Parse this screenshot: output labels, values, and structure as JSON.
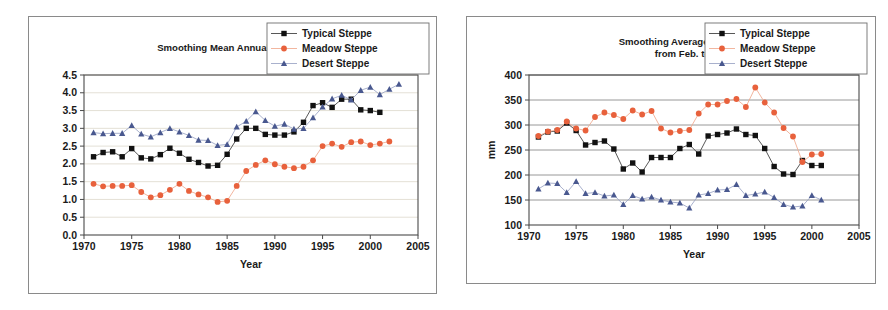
{
  "figure": {
    "background": "#ffffff",
    "panel_border": "#8a8a8a"
  },
  "series_styles": {
    "typical": {
      "name": "Typical Steppe",
      "color": "#111111",
      "line_color": "#3a3a3a",
      "marker": "square"
    },
    "meadow": {
      "name": "Meadow Steppe",
      "color": "#E8613C",
      "line_color": "#F0A98E",
      "marker": "circle"
    },
    "desert": {
      "name": "Desert Steppe",
      "color": "#49588F",
      "line_color": "#9AA3C4",
      "marker": "triangle"
    }
  },
  "legend": {
    "entries": [
      {
        "key": "typical",
        "label": "Typical Steppe"
      },
      {
        "key": "meadow",
        "label": "Meadow Steppe"
      },
      {
        "key": "desert",
        "label": "Desert Steppe"
      }
    ]
  },
  "chart_data": [
    {
      "id": "temperature",
      "type": "line",
      "title": "Smoothing Mean Annual temperature (□ )",
      "title_lines": [
        "Smoothing Mean Annual temperature (□ )"
      ],
      "xlabel": "Year",
      "ylabel": "",
      "xlim": [
        1970,
        2005
      ],
      "ylim": [
        0.0,
        4.5
      ],
      "xticks": [
        1970,
        1975,
        1980,
        1985,
        1990,
        1995,
        2000,
        2005
      ],
      "yticks": [
        "0.0",
        "0.5",
        "1.0",
        "1.5",
        "2.0",
        "2.5",
        "3.0",
        "3.5",
        "4.0",
        "4.5"
      ],
      "grid": "horizontal-faint",
      "legend_position": "top-right",
      "x": [
        1971,
        1972,
        1973,
        1974,
        1975,
        1976,
        1977,
        1978,
        1979,
        1980,
        1981,
        1982,
        1983,
        1984,
        1985,
        1986,
        1987,
        1988,
        1989,
        1990,
        1991,
        1992,
        1993,
        1994,
        1995,
        1996,
        1997,
        1998,
        1999,
        2000,
        2001
      ],
      "series": [
        {
          "name": "Typical Steppe",
          "key": "typical",
          "values": [
            2.2,
            2.32,
            2.34,
            2.2,
            2.43,
            2.17,
            2.14,
            2.26,
            2.44,
            2.3,
            2.13,
            2.04,
            1.94,
            1.96,
            2.27,
            2.7,
            3.0,
            3.0,
            2.83,
            2.81,
            2.81,
            2.9,
            3.17,
            3.64,
            3.72,
            3.59,
            3.82,
            3.82,
            3.52,
            3.5,
            3.45
          ]
        },
        {
          "name": "Meadow Steppe",
          "key": "meadow",
          "values": [
            1.44,
            1.37,
            1.38,
            1.38,
            1.4,
            1.21,
            1.06,
            1.12,
            1.27,
            1.44,
            1.24,
            1.14,
            1.06,
            0.93,
            0.96,
            1.38,
            1.8,
            1.97,
            2.1,
            1.99,
            1.92,
            1.88,
            1.92,
            2.1,
            2.5,
            2.57,
            2.48,
            2.61,
            2.63,
            2.53,
            2.57,
            2.63
          ]
        },
        {
          "name": "Desert Steppe",
          "key": "desert",
          "values": [
            2.88,
            2.85,
            2.86,
            2.86,
            3.08,
            2.84,
            2.76,
            2.88,
            3.0,
            2.9,
            2.8,
            2.67,
            2.66,
            2.52,
            2.55,
            3.04,
            3.2,
            3.47,
            3.22,
            3.06,
            3.12,
            2.98,
            3.0,
            3.3,
            3.6,
            3.83,
            3.93,
            3.8,
            4.07,
            4.16,
            3.95,
            4.1,
            4.24
          ]
        }
      ]
    },
    {
      "id": "precipitation",
      "type": "line",
      "title": "Smoothing Average Precipitation from Feb. to Sep.",
      "title_lines": [
        "Smoothing Average Precipitation",
        "from Feb. to Sep."
      ],
      "xlabel": "Year",
      "ylabel": "mm",
      "xlim": [
        1970,
        2005
      ],
      "ylim": [
        100,
        400
      ],
      "xticks": [
        1970,
        1975,
        1980,
        1985,
        1990,
        1995,
        2000,
        2005
      ],
      "yticks": [
        "100",
        "150",
        "200",
        "250",
        "300",
        "350",
        "400"
      ],
      "grid": "horizontal-solid",
      "legend_position": "top-right",
      "x": [
        1971,
        1972,
        1973,
        1974,
        1975,
        1976,
        1977,
        1978,
        1979,
        1980,
        1981,
        1982,
        1983,
        1984,
        1985,
        1986,
        1987,
        1988,
        1989,
        1990,
        1991,
        1992,
        1993,
        1994,
        1995,
        1996,
        1997,
        1998,
        1999,
        2000,
        2001
      ],
      "series": [
        {
          "name": "Typical Steppe",
          "key": "typical",
          "values": [
            276,
            286,
            288,
            304,
            289,
            260,
            265,
            268,
            252,
            212,
            224,
            206,
            235,
            235,
            235,
            253,
            261,
            242,
            278,
            281,
            284,
            292,
            281,
            279,
            253,
            217,
            202,
            201,
            229,
            219,
            219
          ]
        },
        {
          "name": "Meadow Steppe",
          "key": "meadow",
          "values": [
            278,
            287,
            290,
            307,
            293,
            289,
            316,
            325,
            320,
            312,
            329,
            321,
            328,
            293,
            285,
            288,
            290,
            323,
            341,
            341,
            348,
            352,
            336,
            375,
            345,
            325,
            294,
            277,
            226,
            241,
            242
          ]
        },
        {
          "name": "Desert Steppe",
          "key": "desert",
          "values": [
            172,
            184,
            183,
            165,
            187,
            163,
            165,
            158,
            160,
            141,
            159,
            152,
            156,
            150,
            146,
            144,
            134,
            160,
            163,
            170,
            171,
            181,
            159,
            162,
            166,
            155,
            141,
            136,
            138,
            159,
            150
          ]
        }
      ]
    }
  ]
}
